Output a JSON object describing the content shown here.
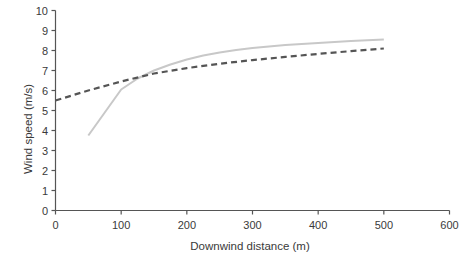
{
  "chart_data": {
    "type": "line",
    "title": "",
    "xlabel": "Downwind distance (m)",
    "ylabel": "Wind speed (m/s)",
    "xlim": [
      0,
      600
    ],
    "ylim": [
      0,
      10
    ],
    "xticks": [
      0,
      100,
      200,
      300,
      400,
      500,
      600
    ],
    "yticks": [
      0,
      1,
      2,
      3,
      4,
      5,
      6,
      7,
      8,
      9,
      10
    ],
    "xtick_labels": [
      "0",
      "100",
      "200",
      "300",
      "400",
      "500",
      "600"
    ],
    "ytick_labels": [
      "0",
      "1",
      "2",
      "3",
      "4",
      "5",
      "6",
      "7",
      "8",
      "9",
      "10"
    ],
    "grid": false,
    "legend": "none",
    "series": [
      {
        "name": "solid-light-gray",
        "style": "solid",
        "color": "#c8c8c8",
        "width": 2.0,
        "x": [
          50,
          100,
          125,
          150,
          175,
          200,
          225,
          250,
          275,
          300,
          325,
          350,
          375,
          400,
          425,
          450,
          475,
          500
        ],
        "y": [
          3.75,
          6.05,
          6.6,
          7.0,
          7.3,
          7.55,
          7.75,
          7.9,
          8.02,
          8.12,
          8.2,
          8.27,
          8.33,
          8.38,
          8.43,
          8.47,
          8.51,
          8.55
        ]
      },
      {
        "name": "dashed-dark-gray",
        "style": "dashed",
        "color": "#555555",
        "width": 2.2,
        "dash": "6,4",
        "x": [
          0,
          50,
          100,
          150,
          200,
          250,
          300,
          350,
          400,
          450,
          500
        ],
        "y": [
          5.5,
          6.0,
          6.45,
          6.85,
          7.12,
          7.34,
          7.52,
          7.68,
          7.83,
          7.97,
          8.1
        ]
      }
    ]
  },
  "axis": {
    "axis_color": "#555555",
    "tick_color": "#555555",
    "text_color": "#3a3a3a"
  }
}
